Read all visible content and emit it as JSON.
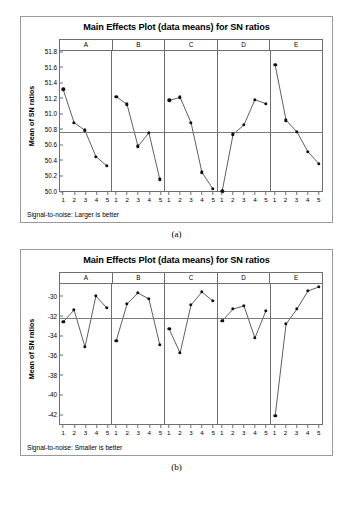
{
  "figures": [
    {
      "caption": "(a)",
      "title": "Main Effects Plot (data means) for SN ratios",
      "ylabel": "Mean of SN ratios",
      "footnote": "Signal-to-noise: Larger is better",
      "chart_data": {
        "type": "line",
        "title": "Main Effects Plot (data means) for SN ratios",
        "xlabel": "",
        "ylabel": "Mean of SN ratios",
        "ylim": [
          50.0,
          51.8
        ],
        "yticks": [
          "50.0",
          "50.2",
          "50.4",
          "50.6",
          "50.8",
          "51.0",
          "51.2",
          "51.4",
          "51.6",
          "51.8"
        ],
        "ytick_values": [
          50.0,
          50.2,
          50.4,
          50.6,
          50.8,
          51.0,
          51.2,
          51.4,
          51.6,
          51.8
        ],
        "grid": false,
        "legend": "none",
        "reference_line": 50.755,
        "categories": [
          "1",
          "2",
          "3",
          "4",
          "5"
        ],
        "panels": [
          {
            "name": "A",
            "values": [
              51.3,
              50.88,
              50.78,
              50.45,
              50.33
            ]
          },
          {
            "name": "B",
            "values": [
              51.21,
              51.11,
              50.58,
              50.75,
              50.16
            ]
          },
          {
            "name": "C",
            "values": [
              51.16,
              51.2,
              50.88,
              50.25,
              50.04
            ]
          },
          {
            "name": "D",
            "values": [
              50.01,
              50.73,
              50.85,
              51.17,
              51.12
            ]
          },
          {
            "name": "E",
            "values": [
              51.61,
              50.91,
              50.76,
              50.51,
              50.36
            ]
          }
        ]
      }
    },
    {
      "caption": "(b)",
      "title": "Main Effects Plot (data means) for SN ratios",
      "ylabel": "Mean of SN ratios",
      "footnote": "Signal-to-noise: Smaller is better",
      "chart_data": {
        "type": "line",
        "title": "Main Effects Plot (data means) for SN ratios",
        "xlabel": "",
        "ylabel": "Mean of SN ratios",
        "ylim": [
          -43.0,
          -28.8
        ],
        "yticks": [
          "-30",
          "-32",
          "-34",
          "-36",
          "-38",
          "-40",
          "-42"
        ],
        "ytick_values": [
          -30,
          -32,
          -34,
          -36,
          -38,
          -40,
          -42
        ],
        "grid": false,
        "legend": "none",
        "reference_line": -32.3,
        "categories": [
          "1",
          "2",
          "3",
          "4",
          "5"
        ],
        "panels": [
          {
            "name": "A",
            "values": [
              -32.7,
              -31.5,
              -35.2,
              -30.1,
              -31.3
            ]
          },
          {
            "name": "B",
            "values": [
              -34.6,
              -30.9,
              -29.8,
              -30.4,
              -35.0
            ]
          },
          {
            "name": "C",
            "values": [
              -33.4,
              -35.8,
              -31.0,
              -29.7,
              -30.6
            ]
          },
          {
            "name": "D",
            "values": [
              -32.6,
              -31.4,
              -31.1,
              -34.3,
              -31.6
            ]
          },
          {
            "name": "E",
            "values": [
              -42.1,
              -32.9,
              -31.4,
              -29.6,
              -29.2
            ]
          }
        ]
      }
    }
  ]
}
